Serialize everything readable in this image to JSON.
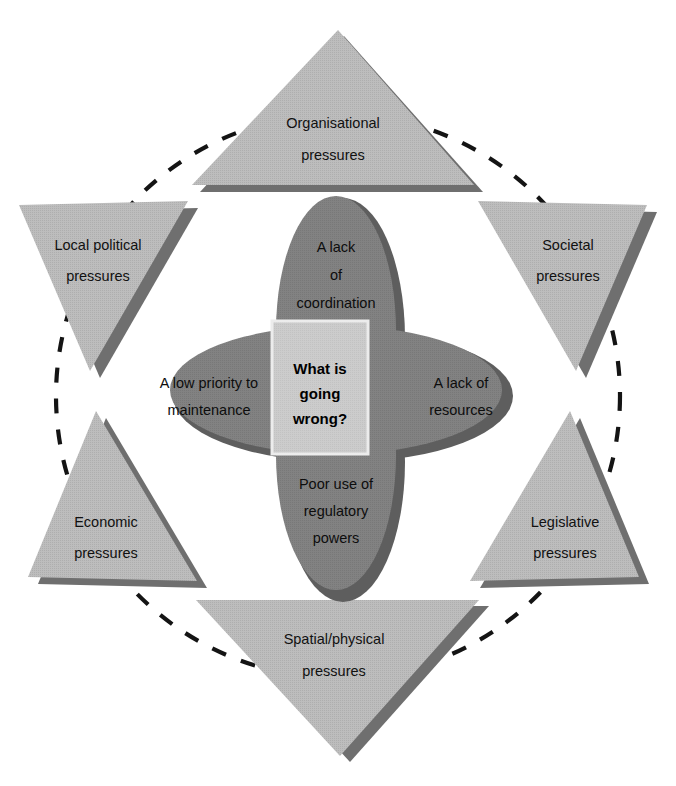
{
  "diagram": {
    "title": "What is going wrong?",
    "colors": {
      "triangle_fill": "#b9b9b9",
      "triangle_shadow": "#6f6f6f",
      "ellipse_fill": "#7e7e7e",
      "ellipse_shadow": "#606060",
      "center_box_fill": "#c9c9c9",
      "center_box_border": "#e8e8e8",
      "dashed_circle": "#111111",
      "background": "#ffffff",
      "text": "#111111"
    },
    "center": {
      "label_lines": [
        "What is",
        "going",
        "wrong?"
      ],
      "full_text": "What is going wrong?"
    },
    "petals": [
      {
        "id": "coordination",
        "position": "top",
        "label_lines": [
          "A lack",
          "of",
          "coordination"
        ],
        "full_text": "A lack of coordination"
      },
      {
        "id": "maintenance",
        "position": "left",
        "label_lines": [
          "A low priority to",
          "maintenance"
        ],
        "full_text": "A low priority to maintenance"
      },
      {
        "id": "resources",
        "position": "right",
        "label_lines": [
          "A lack of",
          "resources"
        ],
        "full_text": "A lack of resources"
      },
      {
        "id": "regulatory",
        "position": "bottom",
        "label_lines": [
          "Poor use of",
          "regulatory",
          "powers"
        ],
        "full_text": "Poor use of regulatory powers"
      }
    ],
    "pressures": [
      {
        "id": "organisational",
        "position": "top",
        "label_lines": [
          "Organisational",
          "pressures"
        ],
        "full_text": "Organisational pressures"
      },
      {
        "id": "societal",
        "position": "upper-right",
        "label_lines": [
          "Societal",
          "pressures"
        ],
        "full_text": "Societal pressures"
      },
      {
        "id": "legislative",
        "position": "lower-right",
        "label_lines": [
          "Legislative",
          "pressures"
        ],
        "full_text": "Legislative pressures"
      },
      {
        "id": "spatial-physical",
        "position": "bottom",
        "label_lines": [
          "Spatial/physical",
          "pressures"
        ],
        "full_text": "Spatial/physical pressures"
      },
      {
        "id": "economic",
        "position": "lower-left",
        "label_lines": [
          "Economic",
          "pressures"
        ],
        "full_text": "Economic pressures"
      },
      {
        "id": "local-political",
        "position": "upper-left",
        "label_lines": [
          "Local political",
          "pressures"
        ],
        "full_text": "Local political pressures"
      }
    ]
  }
}
